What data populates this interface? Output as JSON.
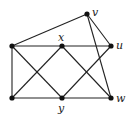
{
  "graph": {
    "nodes": [
      {
        "id": "a",
        "label": "",
        "x": 12,
        "y": 46
      },
      {
        "id": "x",
        "label": "x",
        "x": 62,
        "y": 46
      },
      {
        "id": "u",
        "label": "u",
        "x": 111,
        "y": 46
      },
      {
        "id": "v",
        "label": "v",
        "x": 87,
        "y": 14
      },
      {
        "id": "b",
        "label": "",
        "x": 12,
        "y": 98
      },
      {
        "id": "y",
        "label": "y",
        "x": 62,
        "y": 98
      },
      {
        "id": "w",
        "label": "w",
        "x": 111,
        "y": 98
      }
    ],
    "edges": [
      [
        "a",
        "v"
      ],
      [
        "a",
        "x"
      ],
      [
        "x",
        "u"
      ],
      [
        "a",
        "b"
      ],
      [
        "a",
        "y"
      ],
      [
        "x",
        "b"
      ],
      [
        "x",
        "w"
      ],
      [
        "y",
        "u"
      ],
      [
        "b",
        "y"
      ],
      [
        "y",
        "w"
      ],
      [
        "v",
        "u"
      ],
      [
        "v",
        "w"
      ]
    ],
    "labels": {
      "x": "x",
      "u": "u",
      "v": "v",
      "y": "y",
      "w": "w"
    }
  }
}
